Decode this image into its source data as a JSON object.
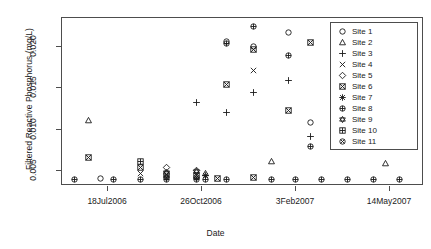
{
  "chart_data": {
    "type": "scatter",
    "title": "",
    "xlabel": "Date",
    "ylabel": "Filtered Reactive Phosphorus (mg/L)",
    "ylim": [
      0.0032,
      0.0235
    ],
    "yticks": [
      0.005,
      0.01,
      0.015,
      0.02
    ],
    "ytick_labels": [
      "0.005",
      "0.010",
      "0.015",
      "0.020"
    ],
    "xticks": [
      "18Jul2006",
      "26Oct2006",
      "3Feb2007",
      "14May2007"
    ],
    "xtick_px": [
      107,
      201,
      295,
      389
    ],
    "grid": "vertical",
    "legend_position": "top-right",
    "gridlines_px": [
      61,
      87,
      113,
      139,
      165,
      191,
      217,
      243,
      269,
      295,
      321,
      347,
      373,
      399,
      423
    ],
    "series": [
      {
        "name": "Site 1",
        "pch": 1,
        "points": [
          [
            100,
            0.004
          ],
          [
            226,
            0.0205
          ],
          [
            253,
            0.0199
          ],
          [
            288,
            0.0216
          ],
          [
            310,
            0.0107
          ]
        ]
      },
      {
        "name": "Site 2",
        "pch": 2,
        "points": [
          [
            88,
            0.011
          ],
          [
            205,
            0.0046
          ],
          [
            271,
            0.006
          ],
          [
            385,
            0.0058
          ]
        ]
      },
      {
        "name": "Site 3",
        "pch": 3,
        "points": [
          [
            196,
            0.0132
          ],
          [
            226,
            0.012
          ],
          [
            253,
            0.0144
          ],
          [
            288,
            0.0158
          ],
          [
            310,
            0.0091
          ]
        ]
      },
      {
        "name": "Site 4",
        "pch": 4,
        "points": [
          [
            140,
            0.0046
          ],
          [
            253,
            0.017
          ]
        ]
      },
      {
        "name": "Site 5",
        "pch": 5,
        "points": [
          [
            166,
            0.0053
          ],
          [
            196,
            0.005
          ]
        ]
      },
      {
        "name": "Site 6",
        "pch": 7,
        "points": [
          [
            88,
            0.0065
          ],
          [
            140,
            0.0053
          ],
          [
            166,
            0.0045
          ],
          [
            196,
            0.0044
          ],
          [
            217,
            0.004
          ],
          [
            226,
            0.0154
          ],
          [
            253,
            0.0196
          ],
          [
            253,
            0.0041
          ],
          [
            288,
            0.0122
          ],
          [
            310,
            0.0204
          ]
        ]
      },
      {
        "name": "Site 7",
        "pch": 8,
        "points": [
          [
            205,
            0.0044
          ]
        ]
      },
      {
        "name": "Site 8",
        "pch": 10,
        "points": [
          [
            74,
            0.0039
          ],
          [
            113,
            0.0039
          ],
          [
            140,
            0.0039
          ],
          [
            166,
            0.0039
          ],
          [
            196,
            0.0039
          ],
          [
            205,
            0.0039
          ],
          [
            226,
            0.0203
          ],
          [
            226,
            0.0039
          ],
          [
            253,
            0.0223
          ],
          [
            271,
            0.0039
          ],
          [
            288,
            0.0189
          ],
          [
            295,
            0.0039
          ],
          [
            310,
            0.0079
          ],
          [
            321,
            0.0039
          ],
          [
            347,
            0.0039
          ],
          [
            373,
            0.0039
          ],
          [
            399,
            0.0039
          ]
        ]
      },
      {
        "name": "Site 9",
        "pch": 11,
        "points": [
          [
            166,
            0.0047
          ],
          [
            196,
            0.0048
          ]
        ]
      },
      {
        "name": "Site 10",
        "pch": 12,
        "points": [
          [
            140,
            0.006
          ]
        ]
      },
      {
        "name": "Site 11",
        "pch": 13,
        "points": [
          [
            166,
            0.0041
          ],
          [
            196,
            0.0041
          ]
        ]
      }
    ]
  },
  "legend": {
    "items": [
      {
        "label": "Site 1",
        "pch": 1
      },
      {
        "label": "Site 2",
        "pch": 2
      },
      {
        "label": "Site 3",
        "pch": 3
      },
      {
        "label": "Site 4",
        "pch": 4
      },
      {
        "label": "Site 5",
        "pch": 5
      },
      {
        "label": "Site 6",
        "pch": 7
      },
      {
        "label": "Site 7",
        "pch": 8
      },
      {
        "label": "Site 8",
        "pch": 10
      },
      {
        "label": "Site 9",
        "pch": 11
      },
      {
        "label": "Site 10",
        "pch": 12
      },
      {
        "label": "Site 11",
        "pch": 13
      }
    ]
  },
  "colors": {
    "axis": "#4d4d4d",
    "grid": "#d4d4d4",
    "point": "#1a1a1a",
    "background": "#ffffff"
  }
}
